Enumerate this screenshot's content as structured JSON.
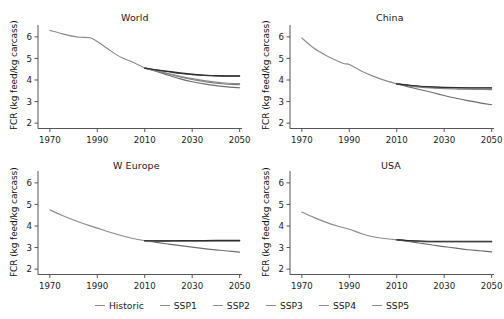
{
  "figure": {
    "ylabel": "FCR (kg feed/kg carcass)",
    "xlabel": "",
    "panels": [
      {
        "title": "World"
      },
      {
        "title": "China"
      },
      {
        "title": "W Europe"
      },
      {
        "title": "USA"
      }
    ]
  },
  "legend": {
    "position": "bottom-center",
    "entries": [
      {
        "label": "Historic",
        "color": "#8c8c8c"
      },
      {
        "label": "SSP1",
        "color": "#8c8c8c"
      },
      {
        "label": "SSP2",
        "color": "#8c8c8c"
      },
      {
        "label": "SSP3",
        "color": "#8c8c8c"
      },
      {
        "label": "SSP4",
        "color": "#8c8c8c"
      },
      {
        "label": "SSP5",
        "color": "#8c8c8c"
      }
    ]
  },
  "axes": {
    "x_ticks": [
      "1970",
      "1990",
      "2010",
      "2030",
      "2050"
    ],
    "x_tick_values": [
      1970,
      1990,
      2010,
      2030,
      2050
    ],
    "y_ticks": [
      "2",
      "3",
      "4",
      "5",
      "6"
    ],
    "y_tick_values": [
      2,
      3,
      4,
      5,
      6
    ],
    "xlim": [
      1965,
      2051
    ],
    "ylim": [
      1.75,
      6.55
    ]
  },
  "chart_data": [
    {
      "type": "line",
      "title": "World",
      "xlabel": "",
      "ylabel": "FCR (kg feed/kg carcass)",
      "xlim": [
        1965,
        2051
      ],
      "ylim": [
        1.75,
        6.55
      ],
      "grid": false,
      "x_ticks": [
        1970,
        1990,
        2010,
        2030,
        2050
      ],
      "y_ticks": [
        2,
        3,
        4,
        5,
        6
      ],
      "series": [
        {
          "name": "Historic",
          "color": "#8c8c8c",
          "x": [
            1970,
            1975,
            1980,
            1983,
            1987,
            1990,
            1995,
            2000,
            2005,
            2010
          ],
          "values": [
            6.3,
            6.15,
            6.02,
            5.98,
            5.96,
            5.78,
            5.4,
            5.05,
            4.82,
            4.55
          ]
        },
        {
          "name": "SSP1",
          "color": "#6e6e6e",
          "x": [
            2010,
            2015,
            2020,
            2025,
            2030,
            2035,
            2040,
            2045,
            2050
          ],
          "values": [
            4.55,
            4.4,
            4.22,
            4.05,
            3.92,
            3.82,
            3.74,
            3.68,
            3.64
          ]
        },
        {
          "name": "SSP2",
          "color": "#7a7a7a",
          "x": [
            2010,
            2015,
            2020,
            2025,
            2030,
            2035,
            2040,
            2045,
            2050
          ],
          "values": [
            4.55,
            4.42,
            4.28,
            4.14,
            4.02,
            3.93,
            3.85,
            3.8,
            3.78
          ]
        },
        {
          "name": "SSP3",
          "color": "#3a3a3a",
          "x": [
            2010,
            2015,
            2020,
            2025,
            2030,
            2035,
            2040,
            2045,
            2050
          ],
          "values": [
            4.55,
            4.46,
            4.38,
            4.3,
            4.25,
            4.21,
            4.19,
            4.18,
            4.18
          ]
        },
        {
          "name": "SSP4",
          "color": "#8a8a8a",
          "x": [
            2010,
            2015,
            2020,
            2025,
            2030,
            2035,
            2040,
            2045,
            2050
          ],
          "values": [
            4.55,
            4.43,
            4.3,
            4.17,
            4.06,
            3.97,
            3.9,
            3.85,
            3.83
          ]
        },
        {
          "name": "SSP5",
          "color": "#2e2e2e",
          "x": [
            2010,
            2015,
            2020,
            2025,
            2030,
            2035,
            2040,
            2045,
            2050
          ],
          "values": [
            4.55,
            4.47,
            4.4,
            4.33,
            4.27,
            4.23,
            4.2,
            4.19,
            4.19
          ]
        }
      ]
    },
    {
      "type": "line",
      "title": "China",
      "xlabel": "",
      "ylabel": "FCR (kg feed/kg carcass)",
      "xlim": [
        1965,
        2051
      ],
      "ylim": [
        1.75,
        6.55
      ],
      "grid": false,
      "x_ticks": [
        1970,
        1990,
        2010,
        2030,
        2050
      ],
      "y_ticks": [
        2,
        3,
        4,
        5,
        6
      ],
      "series": [
        {
          "name": "Historic",
          "color": "#8c8c8c",
          "x": [
            1970,
            1975,
            1980,
            1985,
            1988,
            1990,
            1995,
            2000,
            2005,
            2010
          ],
          "values": [
            5.95,
            5.48,
            5.15,
            4.88,
            4.75,
            4.72,
            4.42,
            4.18,
            3.98,
            3.82
          ]
        },
        {
          "name": "SSP1",
          "color": "#6e6e6e",
          "x": [
            2010,
            2015,
            2020,
            2025,
            2030,
            2035,
            2040,
            2045,
            2050
          ],
          "values": [
            3.82,
            3.68,
            3.55,
            3.42,
            3.28,
            3.15,
            3.04,
            2.94,
            2.85
          ]
        },
        {
          "name": "SSP2",
          "color": "#7a7a7a",
          "x": [
            2010,
            2015,
            2020,
            2025,
            2030,
            2035,
            2040,
            2045,
            2050
          ],
          "values": [
            3.82,
            3.73,
            3.67,
            3.63,
            3.6,
            3.58,
            3.57,
            3.56,
            3.55
          ]
        },
        {
          "name": "SSP3",
          "color": "#3a3a3a",
          "x": [
            2010,
            2015,
            2020,
            2025,
            2030,
            2035,
            2040,
            2045,
            2050
          ],
          "values": [
            3.82,
            3.75,
            3.7,
            3.67,
            3.65,
            3.64,
            3.63,
            3.63,
            3.63
          ]
        },
        {
          "name": "SSP4",
          "color": "#8a8a8a",
          "x": [
            2010,
            2015,
            2020,
            2025,
            2030,
            2035,
            2040,
            2045,
            2050
          ],
          "values": [
            3.82,
            3.74,
            3.69,
            3.65,
            3.63,
            3.61,
            3.6,
            3.59,
            3.58
          ]
        },
        {
          "name": "SSP5",
          "color": "#2e2e2e",
          "x": [
            2010,
            2015,
            2020,
            2025,
            2030,
            2035,
            2040,
            2045,
            2050
          ],
          "values": [
            3.82,
            3.76,
            3.71,
            3.68,
            3.66,
            3.65,
            3.64,
            3.64,
            3.64
          ]
        }
      ]
    },
    {
      "type": "line",
      "title": "W Europe",
      "xlabel": "",
      "ylabel": "FCR (kg feed/kg carcass)",
      "xlim": [
        1965,
        2051
      ],
      "ylim": [
        1.75,
        6.55
      ],
      "grid": false,
      "x_ticks": [
        1970,
        1990,
        2010,
        2030,
        2050
      ],
      "y_ticks": [
        2,
        3,
        4,
        5,
        6
      ],
      "series": [
        {
          "name": "Historic",
          "color": "#8c8c8c",
          "x": [
            1970,
            1975,
            1980,
            1985,
            1990,
            1995,
            2000,
            2005,
            2010
          ],
          "values": [
            4.75,
            4.5,
            4.28,
            4.08,
            3.9,
            3.72,
            3.56,
            3.42,
            3.32
          ]
        },
        {
          "name": "SSP1",
          "color": "#6e6e6e",
          "x": [
            2010,
            2015,
            2020,
            2025,
            2030,
            2035,
            2040,
            2045,
            2050
          ],
          "values": [
            3.32,
            3.24,
            3.16,
            3.09,
            3.02,
            2.95,
            2.89,
            2.84,
            2.79
          ]
        },
        {
          "name": "SSP2",
          "color": "#7a7a7a",
          "x": [
            2010,
            2015,
            2020,
            2025,
            2030,
            2035,
            2040,
            2045,
            2050
          ],
          "values": [
            3.32,
            3.3,
            3.3,
            3.3,
            3.3,
            3.31,
            3.31,
            3.31,
            3.31
          ]
        },
        {
          "name": "SSP3",
          "color": "#3a3a3a",
          "x": [
            2010,
            2015,
            2020,
            2025,
            2030,
            2035,
            2040,
            2045,
            2050
          ],
          "values": [
            3.32,
            3.31,
            3.31,
            3.31,
            3.32,
            3.32,
            3.32,
            3.32,
            3.32
          ]
        },
        {
          "name": "SSP4",
          "color": "#8a8a8a",
          "x": [
            2010,
            2015,
            2020,
            2025,
            2030,
            2035,
            2040,
            2045,
            2050
          ],
          "values": [
            3.32,
            3.3,
            3.29,
            3.29,
            3.29,
            3.3,
            3.3,
            3.3,
            3.3
          ]
        },
        {
          "name": "SSP5",
          "color": "#2e2e2e",
          "x": [
            2010,
            2015,
            2020,
            2025,
            2030,
            2035,
            2040,
            2045,
            2050
          ],
          "values": [
            3.32,
            3.31,
            3.31,
            3.32,
            3.32,
            3.32,
            3.33,
            3.33,
            3.33
          ]
        }
      ]
    },
    {
      "type": "line",
      "title": "USA",
      "xlabel": "",
      "ylabel": "FCR (kg feed/kg carcass)",
      "xlim": [
        1965,
        2051
      ],
      "ylim": [
        1.75,
        6.55
      ],
      "grid": false,
      "x_ticks": [
        1970,
        1990,
        2010,
        2030,
        2050
      ],
      "y_ticks": [
        2,
        3,
        4,
        5,
        6
      ],
      "series": [
        {
          "name": "Historic",
          "color": "#8c8c8c",
          "x": [
            1970,
            1975,
            1980,
            1985,
            1990,
            1995,
            2000,
            2005,
            2010
          ],
          "values": [
            4.65,
            4.4,
            4.18,
            4.0,
            3.85,
            3.65,
            3.5,
            3.42,
            3.36
          ]
        },
        {
          "name": "SSP1",
          "color": "#6e6e6e",
          "x": [
            2010,
            2015,
            2020,
            2025,
            2030,
            2035,
            2040,
            2045,
            2050
          ],
          "values": [
            3.36,
            3.28,
            3.2,
            3.12,
            3.04,
            2.97,
            2.9,
            2.85,
            2.8
          ]
        },
        {
          "name": "SSP2",
          "color": "#7a7a7a",
          "x": [
            2010,
            2015,
            2020,
            2025,
            2030,
            2035,
            2040,
            2045,
            2050
          ],
          "values": [
            3.36,
            3.31,
            3.28,
            3.27,
            3.27,
            3.27,
            3.27,
            3.27,
            3.27
          ]
        },
        {
          "name": "SSP3",
          "color": "#3a3a3a",
          "x": [
            2010,
            2015,
            2020,
            2025,
            2030,
            2035,
            2040,
            2045,
            2050
          ],
          "values": [
            3.36,
            3.32,
            3.29,
            3.28,
            3.28,
            3.28,
            3.28,
            3.28,
            3.28
          ]
        },
        {
          "name": "SSP4",
          "color": "#8a8a8a",
          "x": [
            2010,
            2015,
            2020,
            2025,
            2030,
            2035,
            2040,
            2045,
            2050
          ],
          "values": [
            3.36,
            3.31,
            3.28,
            3.26,
            3.26,
            3.26,
            3.26,
            3.26,
            3.26
          ]
        },
        {
          "name": "SSP5",
          "color": "#2e2e2e",
          "x": [
            2010,
            2015,
            2020,
            2025,
            2030,
            2035,
            2040,
            2045,
            2050
          ],
          "values": [
            3.36,
            3.32,
            3.3,
            3.29,
            3.29,
            3.29,
            3.29,
            3.29,
            3.29
          ]
        }
      ]
    }
  ]
}
